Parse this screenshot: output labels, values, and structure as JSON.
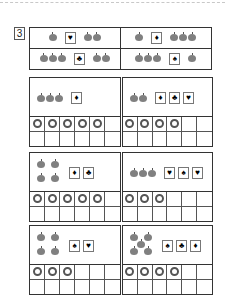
{
  "question_number": "3",
  "header": {
    "cells": [
      {
        "left_apples": 1,
        "card": "heart",
        "right_apples": 2
      },
      {
        "left_apples": 1,
        "card": "diamond",
        "right_apples": 3
      },
      {
        "left_apples": 3,
        "card": "club",
        "right_apples": 2
      },
      {
        "left_apples": 3,
        "card": "spade",
        "right_apples": 1
      }
    ]
  },
  "suits": {
    "heart": "♥",
    "diamond": "♦",
    "club": "♣",
    "spade": "♠"
  },
  "panels": [
    {
      "apples": 3,
      "arrangement": "row",
      "cards": [
        "diamond"
      ],
      "rings": 5,
      "grid_cols": 6,
      "grid_rows": 2
    },
    {
      "apples": 2,
      "arrangement": "row",
      "cards": [
        "diamond",
        "club",
        "heart"
      ],
      "rings": 4,
      "grid_cols": 6,
      "grid_rows": 2
    },
    {
      "apples": 4,
      "arrangement": "square",
      "cards": [
        "diamond",
        "club"
      ],
      "rings": 5,
      "grid_cols": 6,
      "grid_rows": 2
    },
    {
      "apples": 3,
      "arrangement": "row",
      "cards": [
        "heart",
        "spade",
        "heart"
      ],
      "rings": 3,
      "grid_cols": 6,
      "grid_rows": 2
    },
    {
      "apples": 4,
      "arrangement": "square",
      "cards": [
        "spade",
        "heart"
      ],
      "rings": 3,
      "grid_cols": 6,
      "grid_rows": 2
    },
    {
      "apples": 5,
      "arrangement": "dice",
      "cards": [
        "spade",
        "club",
        "diamond"
      ],
      "rings": 4,
      "grid_cols": 6,
      "grid_rows": 2
    }
  ]
}
